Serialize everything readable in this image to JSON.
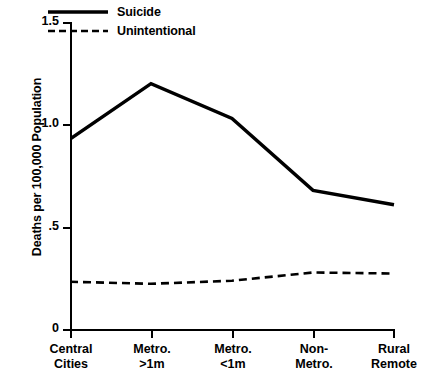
{
  "chart_data": {
    "type": "line",
    "title": "",
    "xlabel": "",
    "ylabel": "Deaths per 100,000 Population",
    "categories": [
      "Central Cities",
      "Metro. >1m",
      "Metro. <1m",
      "Non-Metro.",
      "Rural Remote"
    ],
    "category_lines": [
      [
        "Central",
        "Cities"
      ],
      [
        "Metro.",
        ">1m"
      ],
      [
        "Metro.",
        "<1m"
      ],
      [
        "Non-",
        "Metro."
      ],
      [
        "Rural",
        "Remote"
      ]
    ],
    "series": [
      {
        "name": "Suicide",
        "style": "solid",
        "color": "#000000",
        "values": [
          0.93,
          1.2,
          1.03,
          0.68,
          0.61
        ]
      },
      {
        "name": "Unintentional",
        "style": "dashed",
        "color": "#000000",
        "values": [
          0.235,
          0.225,
          0.24,
          0.28,
          0.275
        ]
      }
    ],
    "ylim": [
      0,
      1.5
    ],
    "yticks": [
      0,
      0.5,
      1.0,
      1.5
    ],
    "ytick_labels": [
      "0",
      ".5",
      "1.0",
      "1.5"
    ],
    "grid": false,
    "legend_position": "top-center-inside"
  },
  "legend": {
    "items": [
      {
        "label": "Suicide",
        "style": "solid"
      },
      {
        "label": "Unintentional",
        "style": "dashed"
      }
    ]
  },
  "caption": {
    "text": ""
  }
}
